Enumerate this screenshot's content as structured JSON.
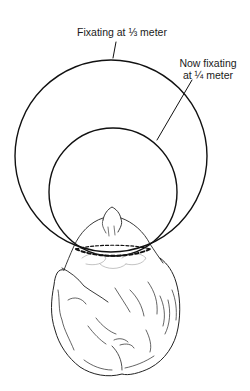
{
  "figure": {
    "type": "diagram",
    "labels": {
      "outer_circle": "Fixating at ⅓ meter",
      "inner_circle_line1": "Now fixating",
      "inner_circle_line2": "at ¼ meter"
    },
    "elements": {
      "outer_circle": {
        "cx": 111,
        "cy": 156,
        "r": 96,
        "stroke": "#111111",
        "represents": "fixation at 1/3 meter"
      },
      "inner_circle": {
        "cx": 113,
        "cy": 192,
        "r": 64,
        "stroke": "#111111",
        "represents": "fixation at 1/4 meter"
      },
      "interocular_line": {
        "style": "dashed",
        "from": [
          76,
          249
        ],
        "to": [
          150,
          249
        ],
        "stroke": "#111111"
      },
      "head": {
        "view": "top-down",
        "style": "line sketch"
      }
    },
    "colors": {
      "background": "#ffffff",
      "ink": "#111111"
    }
  }
}
